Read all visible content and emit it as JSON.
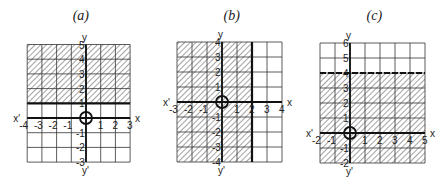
{
  "figure": {
    "colors": {
      "line": "#111111",
      "hatch": "#555555",
      "background": "#ffffff"
    },
    "panels": [
      {
        "id": "a",
        "title": "(a)",
        "x_label": "x",
        "x_prime_label": "x'",
        "y_label": "y",
        "y_prime_label": "y'",
        "x_range": [
          -4,
          3
        ],
        "y_range": [
          -3,
          5
        ],
        "x_ticks": [
          "-4",
          "-3",
          "-2",
          "-1",
          "1",
          "2",
          "3"
        ],
        "y_ticks": [
          "-3",
          "-2",
          "-1",
          "1",
          "2",
          "3",
          "4",
          "5"
        ],
        "inequality": "y ≥ 1",
        "boundary": {
          "type": "horizontal",
          "value": 1,
          "style": "solid"
        },
        "shaded_region": {
          "x": [
            -4,
            3
          ],
          "y": [
            1,
            5
          ]
        },
        "origin_marker": "circle",
        "pixel_origin": [
          86,
          118
        ],
        "unit_px": 14.7
      },
      {
        "id": "b",
        "title": "(b)",
        "x_label": "x",
        "x_prime_label": "x'",
        "y_label": "y",
        "y_prime_label": "y'",
        "x_range": [
          -3,
          4
        ],
        "y_range": [
          -4,
          4
        ],
        "x_ticks": [
          "-3",
          "-2",
          "-1",
          "1",
          "2",
          "3",
          "4"
        ],
        "y_ticks": [
          "-4",
          "-3",
          "-2",
          "-1",
          "1",
          "2",
          "3",
          "4"
        ],
        "inequality": "x ≤ 2",
        "boundary": {
          "type": "vertical",
          "value": 2,
          "style": "solid"
        },
        "shaded_region": {
          "x": [
            -3,
            2
          ],
          "y": [
            -4,
            4
          ]
        },
        "origin_marker": "circle",
        "pixel_origin": [
          222,
          102
        ],
        "unit_px": 15
      },
      {
        "id": "c",
        "title": "(c)",
        "x_label": "x",
        "x_prime_label": "x'",
        "y_label": "y",
        "y_prime_label": "y'",
        "x_range": [
          -2,
          5
        ],
        "y_range": [
          -2,
          6
        ],
        "x_ticks": [
          "-2",
          "-1",
          "1",
          "2",
          "3",
          "4",
          "5"
        ],
        "y_ticks": [
          "-2",
          "-1",
          "1",
          "2",
          "3",
          "4",
          "5",
          "6"
        ],
        "inequality": "y < 4",
        "boundary": {
          "type": "horizontal",
          "value": 4,
          "style": "dashed"
        },
        "shaded_region": {
          "x": [
            -2,
            5
          ],
          "y": [
            -2,
            4
          ]
        },
        "origin_marker": "circle",
        "pixel_origin": [
          350,
          133
        ],
        "unit_px": 15
      }
    ]
  }
}
